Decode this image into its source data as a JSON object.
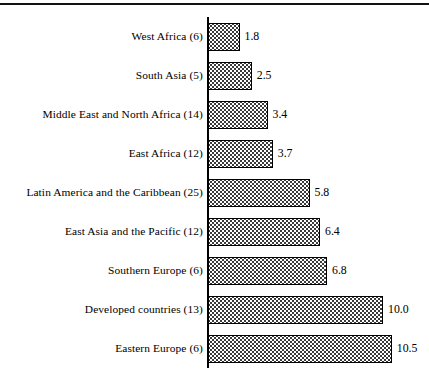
{
  "figure": {
    "has_top_rule": true,
    "background_color": "#ffffff",
    "ink_color": "#000000"
  },
  "chart_data": {
    "type": "bar",
    "orientation": "horizontal",
    "title": "",
    "subtitle": "",
    "xlabel": "",
    "ylabel": "",
    "grid": false,
    "legend": null,
    "axis_range": [
      0,
      10.5
    ],
    "value_label_format": "one decimal",
    "categories": [
      "West Africa (6)",
      "South Asia (5)",
      "Middle East and North Africa (14)",
      "East Africa (12)",
      "Latin America and the Caribbean (25)",
      "East Asia and the Pacific (12)",
      "Southern Europe (6)",
      "Developed countries (13)",
      "Eastern Europe (6)"
    ],
    "values": [
      1.8,
      2.5,
      3.4,
      3.7,
      5.8,
      6.4,
      6.8,
      10.0,
      10.5
    ],
    "value_labels": [
      "1.8",
      "2.5",
      "3.4",
      "3.7",
      "5.8",
      "6.4",
      "6.8",
      "10.0",
      "10.5"
    ],
    "bars": [
      {
        "category": "West Africa (6)",
        "count_in_label": 6,
        "value": 1.8,
        "value_label": "1.8"
      },
      {
        "category": "South Asia (5)",
        "count_in_label": 5,
        "value": 2.5,
        "value_label": "2.5"
      },
      {
        "category": "Middle East and North Africa (14)",
        "count_in_label": 14,
        "value": 3.4,
        "value_label": "3.4"
      },
      {
        "category": "East Africa (12)",
        "count_in_label": 12,
        "value": 3.7,
        "value_label": "3.7"
      },
      {
        "category": "Latin America and the Caribbean (25)",
        "count_in_label": 25,
        "value": 5.8,
        "value_label": "5.8"
      },
      {
        "category": "East Asia and the Pacific (12)",
        "count_in_label": 12,
        "value": 6.4,
        "value_label": "6.4"
      },
      {
        "category": "Southern Europe (6)",
        "count_in_label": 6,
        "value": 6.8,
        "value_label": "6.8"
      },
      {
        "category": "Developed countries (13)",
        "count_in_label": 13,
        "value": 10.0,
        "value_label": "10.0"
      },
      {
        "category": "Eastern Europe (6)",
        "count_in_label": 6,
        "value": 10.5,
        "value_label": "10.5"
      }
    ]
  },
  "layout": {
    "axis_x": 208,
    "axis_top": 17,
    "row_pitch": 39,
    "bar_height": 28,
    "px_per_unit": 17.5,
    "value_gap": 5
  }
}
